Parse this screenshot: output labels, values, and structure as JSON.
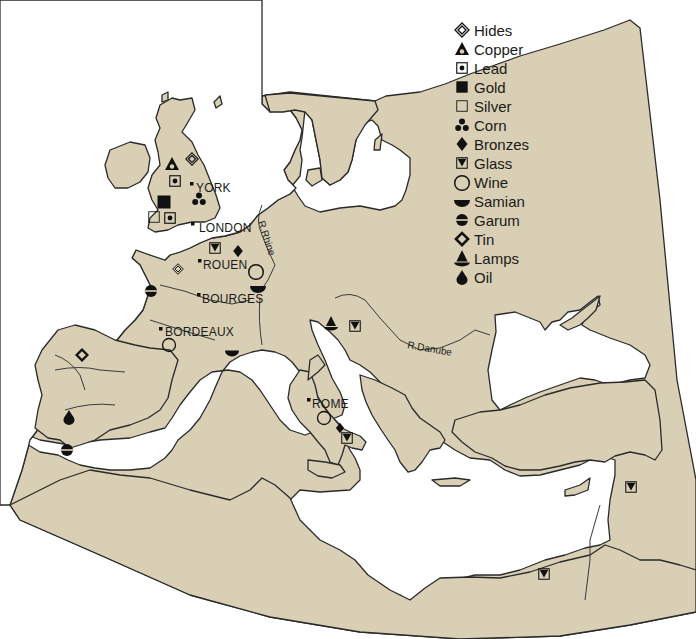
{
  "map": {
    "title": "Roman trade goods of Europe and the Mediterranean",
    "colors": {
      "land": "#d9cfb4",
      "sea": "#ffffff",
      "outline": "#2a2a2a",
      "symbol": "#111111"
    }
  },
  "legend": {
    "items": [
      {
        "symbol": "hides-icon",
        "label": "Hides"
      },
      {
        "symbol": "copper-icon",
        "label": "Copper"
      },
      {
        "symbol": "lead-icon",
        "label": "Lead"
      },
      {
        "symbol": "gold-icon",
        "label": "Gold"
      },
      {
        "symbol": "silver-icon",
        "label": "Silver"
      },
      {
        "symbol": "corn-icon",
        "label": "Corn"
      },
      {
        "symbol": "bronzes-icon",
        "label": "Bronzes"
      },
      {
        "symbol": "glass-icon",
        "label": "Glass"
      },
      {
        "symbol": "wine-icon",
        "label": "Wine"
      },
      {
        "symbol": "samian-icon",
        "label": "Samian"
      },
      {
        "symbol": "garum-icon",
        "label": "Garum"
      },
      {
        "symbol": "tin-icon",
        "label": "Tin"
      },
      {
        "symbol": "lamps-icon",
        "label": "Lamps"
      },
      {
        "symbol": "oil-icon",
        "label": "Oil"
      }
    ]
  },
  "cities": [
    {
      "name": "YORK"
    },
    {
      "name": "LONDON"
    },
    {
      "name": "ROUEN"
    },
    {
      "name": "BOURGES"
    },
    {
      "name": "BORDEAUX"
    },
    {
      "name": "ROME"
    }
  ],
  "rivers": [
    {
      "name": "R.Rhine"
    },
    {
      "name": "R.Danube"
    }
  ],
  "markers": [
    {
      "good": "Copper",
      "region": "Northern Britain"
    },
    {
      "good": "Hides",
      "region": "Northern Britain"
    },
    {
      "good": "Lead",
      "region": "Northern Britain"
    },
    {
      "good": "Gold",
      "region": "Wales"
    },
    {
      "good": "Corn",
      "region": "Eastern Britain"
    },
    {
      "good": "Silver",
      "region": "South-west Britain"
    },
    {
      "good": "Lead",
      "region": "South-west Britain"
    },
    {
      "good": "Glass",
      "region": "Northern Gaul"
    },
    {
      "good": "Bronzes",
      "region": "Northern Gaul"
    },
    {
      "good": "Wine",
      "region": "Eastern Gaul"
    },
    {
      "good": "Hides",
      "region": "Western Gaul"
    },
    {
      "good": "Samian",
      "region": "Central Gaul"
    },
    {
      "good": "Garum",
      "region": "Atlantic Gaul"
    },
    {
      "good": "Wine",
      "region": "Bordeaux"
    },
    {
      "good": "Samian",
      "region": "Southern Gaul"
    },
    {
      "good": "Tin",
      "region": "North-west Spain"
    },
    {
      "good": "Oil",
      "region": "Southern Spain"
    },
    {
      "good": "Garum",
      "region": "Southern Spain"
    },
    {
      "good": "Lamps",
      "region": "Northern Italy"
    },
    {
      "good": "Glass",
      "region": "Northern Italy"
    },
    {
      "good": "Wine",
      "region": "Italy"
    },
    {
      "good": "Bronzes",
      "region": "Italy"
    },
    {
      "good": "Glass",
      "region": "Southern Italy"
    },
    {
      "good": "Glass",
      "region": "Syria"
    },
    {
      "good": "Glass",
      "region": "Egypt"
    }
  ]
}
